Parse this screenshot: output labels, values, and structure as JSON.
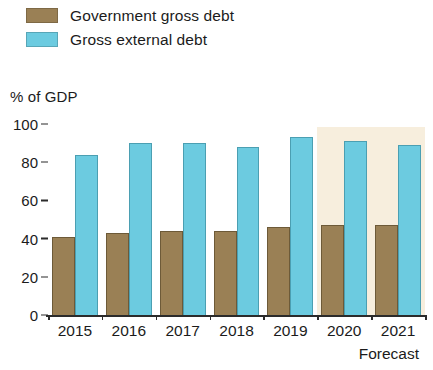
{
  "legend": {
    "items": [
      {
        "label": "Government gross debt",
        "color": "#9a8055",
        "key": "gov"
      },
      {
        "label": "Gross external debt",
        "color": "#6ccbe0",
        "key": "ext"
      }
    ]
  },
  "axis": {
    "y_title": "% of GDP",
    "y_ticks": [
      "100",
      "80",
      "60",
      "40",
      "20",
      "0"
    ]
  },
  "forecast_note": "Forecast",
  "chart_data": {
    "type": "bar",
    "title": "",
    "subtitle": "",
    "xlabel": "",
    "ylabel": "% of GDP",
    "ylim": [
      0,
      100
    ],
    "yticks": [
      0,
      20,
      40,
      60,
      80,
      100
    ],
    "grid": false,
    "legend_position": "top-left",
    "categories": [
      "2015",
      "2016",
      "2017",
      "2018",
      "2019",
      "2020",
      "2021"
    ],
    "series": [
      {
        "name": "Government gross debt",
        "color": "#9a8055",
        "values": [
          41,
          43,
          44,
          44,
          46,
          47,
          47
        ]
      },
      {
        "name": "Gross external debt",
        "color": "#6ccbe0",
        "values": [
          84,
          90,
          90,
          88,
          93,
          91,
          89
        ]
      }
    ],
    "annotations": [
      {
        "text": "Forecast",
        "applies_to": [
          "2020",
          "2021"
        ],
        "shading_color": "#f7eedd"
      }
    ]
  }
}
